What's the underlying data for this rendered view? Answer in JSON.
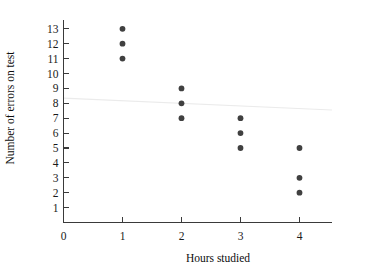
{
  "chart_data": {
    "type": "scatter",
    "title": "",
    "xlabel": "Hours studied",
    "ylabel": "Number of errors on test",
    "xlim": [
      0,
      4.55
    ],
    "ylim": [
      0,
      13.6
    ],
    "grid": false,
    "legend": false,
    "xticks": [
      0,
      1,
      2,
      3,
      4
    ],
    "xtick_labels": [
      "0",
      "1",
      "2",
      "3",
      "4"
    ],
    "yticks": [
      1,
      2,
      3,
      4,
      5,
      6,
      7,
      8,
      9,
      10,
      11,
      12,
      13
    ],
    "ytick_labels": [
      "1",
      "2",
      "3",
      "4",
      "5",
      "6",
      "7",
      "8",
      "9",
      "10",
      "11",
      "12",
      "13"
    ],
    "points": [
      {
        "x": 1,
        "y": 13
      },
      {
        "x": 1,
        "y": 12
      },
      {
        "x": 1,
        "y": 11
      },
      {
        "x": 2,
        "y": 9
      },
      {
        "x": 2,
        "y": 8
      },
      {
        "x": 2,
        "y": 7
      },
      {
        "x": 3,
        "y": 7
      },
      {
        "x": 3,
        "y": 6
      },
      {
        "x": 3,
        "y": 5
      },
      {
        "x": 4,
        "y": 5
      },
      {
        "x": 4,
        "y": 3
      },
      {
        "x": 4,
        "y": 2
      }
    ],
    "trend_line": {
      "x_start": 0,
      "y_start": 8.35,
      "x_end": 4.55,
      "y_end": 7.55
    },
    "marker_color": "#404040",
    "axis_color": "#3a3a3a",
    "trend_color": "#ebebeb"
  }
}
